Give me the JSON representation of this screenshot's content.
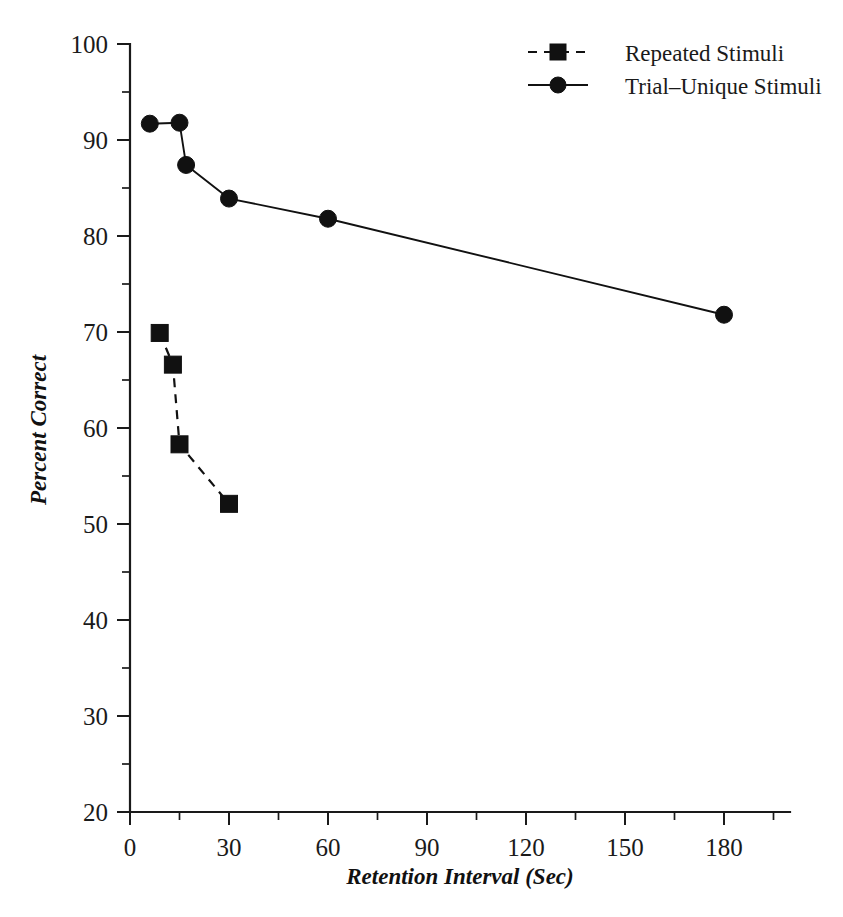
{
  "chart_data": {
    "type": "line",
    "title": "",
    "subtitle": "",
    "xlabel": "Retention Interval (Sec)",
    "ylabel": "Percent Correct",
    "xlim": [
      0,
      200
    ],
    "ylim": [
      20,
      100
    ],
    "grid": false,
    "legend_position": "top-right",
    "x_ticks_major": [
      0,
      30,
      60,
      90,
      120,
      150,
      180
    ],
    "x_tick_labels": [
      "0",
      "30",
      "60",
      "90",
      "120",
      "150",
      "180"
    ],
    "x_ticks_minor": [
      15,
      45,
      75,
      105,
      135,
      165,
      195
    ],
    "y_ticks_major": [
      20,
      30,
      40,
      50,
      60,
      70,
      80,
      90,
      100
    ],
    "y_tick_labels": [
      "20",
      "30",
      "40",
      "50",
      "60",
      "70",
      "80",
      "90",
      "100"
    ],
    "y_ticks_minor": [
      25,
      35,
      45,
      55,
      65,
      75,
      85,
      95
    ],
    "series": [
      {
        "name": "Repeated Stimuli",
        "marker": "square",
        "line_style": "dashed",
        "color": "#111111",
        "points": [
          {
            "x": 9,
            "y": 69.9
          },
          {
            "x": 13,
            "y": 66.6
          },
          {
            "x": 15,
            "y": 58.3
          },
          {
            "x": 30,
            "y": 52.1
          }
        ]
      },
      {
        "name": "Trial–Unique Stimuli",
        "marker": "circle",
        "line_style": "solid",
        "color": "#111111",
        "points": [
          {
            "x": 6,
            "y": 91.7
          },
          {
            "x": 15,
            "y": 91.8
          },
          {
            "x": 17,
            "y": 87.4
          },
          {
            "x": 30,
            "y": 83.9
          },
          {
            "x": 60,
            "y": 81.8
          },
          {
            "x": 180,
            "y": 71.8
          }
        ]
      }
    ]
  },
  "legend": {
    "entries": [
      {
        "label": "Repeated Stimuli",
        "marker": "square",
        "line_style": "dashed"
      },
      {
        "label": "Trial–Unique Stimuli",
        "marker": "circle",
        "line_style": "solid"
      }
    ]
  }
}
